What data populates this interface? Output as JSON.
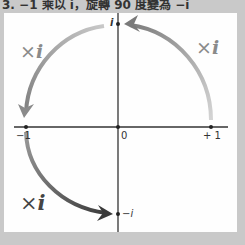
{
  "caption": "3. −1 乘以 i，旋轉 90 度變為 −i",
  "axis_labels": {
    "neg_one": "−1",
    "zero": "0",
    "pos_one": "+ 1",
    "i": "i",
    "neg_i": "−i"
  },
  "multipliers": [
    {
      "position": "top-right",
      "times": "×",
      "symbol": "i"
    },
    {
      "position": "top-left",
      "times": "×",
      "symbol": "i"
    },
    {
      "position": "bottom-left",
      "times": "×",
      "symbol": "i"
    }
  ],
  "arrows": [
    {
      "from": "+1",
      "to": "i",
      "color": "#9a9a9a"
    },
    {
      "from": "i",
      "to": "−1",
      "color": "#a0a0a0"
    },
    {
      "from": "−1",
      "to": "−i",
      "color": "#555555"
    }
  ],
  "colors": {
    "frame": "#c9c9c9",
    "panel": "#fefefe",
    "axis": "#333333"
  }
}
